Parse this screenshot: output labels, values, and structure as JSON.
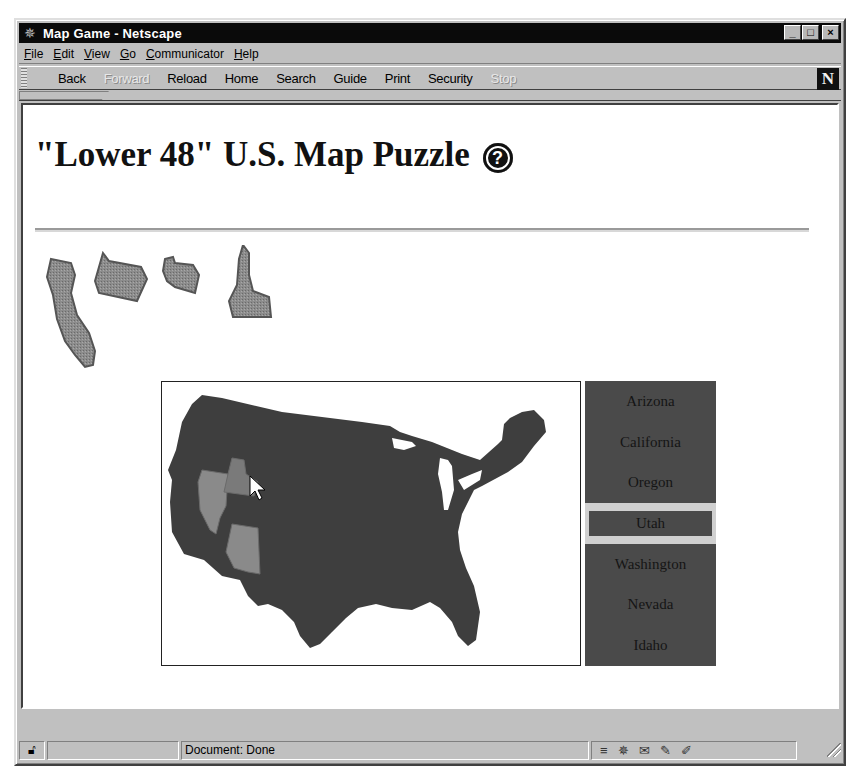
{
  "window": {
    "title": "Map Game - Netscape",
    "controls": {
      "minimize": "_",
      "maximize": "□",
      "close": "×"
    }
  },
  "menubar": {
    "items": [
      {
        "accel": "F",
        "rest": "ile"
      },
      {
        "accel": "E",
        "rest": "dit"
      },
      {
        "accel": "V",
        "rest": "iew"
      },
      {
        "accel": "G",
        "rest": "o"
      },
      {
        "accel": "C",
        "rest": "ommunicator"
      },
      {
        "accel": "H",
        "rest": "elp"
      }
    ]
  },
  "toolbar": {
    "buttons": [
      {
        "label": "Back",
        "enabled": true
      },
      {
        "label": "Forward",
        "enabled": false
      },
      {
        "label": "Reload",
        "enabled": true
      },
      {
        "label": "Home",
        "enabled": true
      },
      {
        "label": "Search",
        "enabled": true
      },
      {
        "label": "Guide",
        "enabled": true
      },
      {
        "label": "Print",
        "enabled": true
      },
      {
        "label": "Security",
        "enabled": true
      },
      {
        "label": "Stop",
        "enabled": false
      }
    ],
    "logo": "N"
  },
  "page": {
    "title": "\"Lower 48\" U.S. Map Puzzle",
    "help_glyph": "?",
    "placed_pieces": [
      "California",
      "Oregon",
      "Washington",
      "Idaho"
    ],
    "state_list": {
      "items": [
        "Arizona",
        "California",
        "Oregon",
        "Utah",
        "Washington",
        "Nevada",
        "Idaho"
      ],
      "selected": "Utah"
    }
  },
  "statusbar": {
    "text": "Document: Done"
  },
  "colors": {
    "map_fill": "#3e3e3e",
    "highlight_fill": "#8a8a8a",
    "list_bg": "#4a4a4a",
    "selected_border": "#d0d0d0"
  }
}
